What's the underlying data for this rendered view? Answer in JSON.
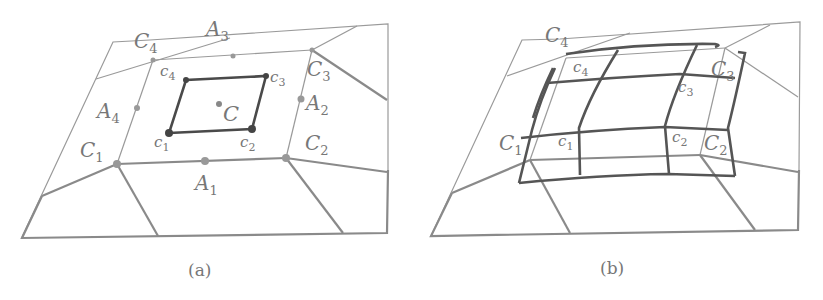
{
  "figure": {
    "panels": [
      {
        "id": "a",
        "caption": "(a)",
        "labels": {
          "C1": {
            "base": "C",
            "sub": "1"
          },
          "C2": {
            "base": "C",
            "sub": "2"
          },
          "C3": {
            "base": "C",
            "sub": "3"
          },
          "C4": {
            "base": "C",
            "sub": "4"
          },
          "A1": {
            "base": "A",
            "sub": "1"
          },
          "A2": {
            "base": "A",
            "sub": "2"
          },
          "A3": {
            "base": "A",
            "sub": "3"
          },
          "A4": {
            "base": "A",
            "sub": "4"
          },
          "c1": {
            "base": "c",
            "sub": "1"
          },
          "c2": {
            "base": "c",
            "sub": "2"
          },
          "c3": {
            "base": "c",
            "sub": "3"
          },
          "c4": {
            "base": "c",
            "sub": "4"
          },
          "C": {
            "base": "C",
            "sub": ""
          }
        }
      },
      {
        "id": "b",
        "caption": "(b)",
        "labels": {
          "C1": {
            "base": "C",
            "sub": "1"
          },
          "C2": {
            "base": "C",
            "sub": "2"
          },
          "C3": {
            "base": "C",
            "sub": "3"
          },
          "C4": {
            "base": "C",
            "sub": "4"
          },
          "c1": {
            "base": "c",
            "sub": "1"
          },
          "c2": {
            "base": "c",
            "sub": "2"
          },
          "c3": {
            "base": "c",
            "sub": "3"
          },
          "c4": {
            "base": "c",
            "sub": "4"
          }
        }
      }
    ],
    "colors": {
      "background": "#ffffff",
      "line_light": "#9a9a9a",
      "line_dark": "#4a4a4a",
      "text": "#777777"
    }
  }
}
